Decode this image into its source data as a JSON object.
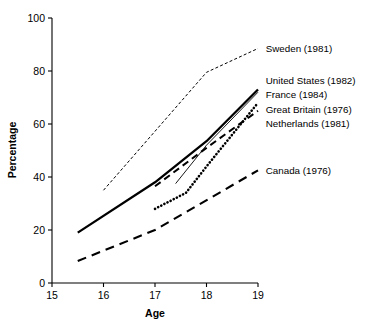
{
  "chart_data": {
    "type": "line",
    "title": "",
    "xlabel": "Age",
    "ylabel": "Percentage",
    "xlim": [
      15,
      19
    ],
    "ylim": [
      0,
      100
    ],
    "xticks": [
      "15",
      "16",
      "17",
      "18",
      "19"
    ],
    "yticks": [
      "0",
      "20",
      "40",
      "60",
      "80",
      "100"
    ],
    "grid": false,
    "legend_position": "right-inline-annotations",
    "series": [
      {
        "name": "Sweden (1981)",
        "label": "Sweden (1981)",
        "style": "fine-dashed",
        "x": [
          16.0,
          18.0,
          19.0
        ],
        "values": [
          35.0,
          79.5,
          88.5
        ],
        "label_x": 19.15,
        "label_y": 88.5
      },
      {
        "name": "United States (1982)",
        "label": "United States (1982)",
        "style": "solid-thick",
        "x": [
          15.5,
          17.0,
          18.0,
          19.0
        ],
        "values": [
          19.0,
          38.0,
          53.5,
          73.0
        ],
        "label_x": 19.15,
        "label_y": 76.5
      },
      {
        "name": "France (1984)",
        "label": "France (1984)",
        "style": "solid-thin",
        "x": [
          17.4,
          18.0,
          19.0
        ],
        "values": [
          37.5,
          52.0,
          72.0
        ],
        "label_x": 19.15,
        "label_y": 71.0
      },
      {
        "name": "Great Britain (1976)",
        "label": "Great Britain (1976)",
        "style": "dotted",
        "x": [
          17.0,
          17.6,
          18.0,
          19.0
        ],
        "values": [
          28.0,
          34.0,
          44.0,
          68.0
        ],
        "label_x": 19.15,
        "label_y": 65.5
      },
      {
        "name": "Netherlands (1981)",
        "label": "Netherlands (1981)",
        "style": "dashed-medium",
        "x": [
          17.0,
          18.0,
          19.0
        ],
        "values": [
          36.5,
          51.0,
          65.0
        ],
        "label_x": 19.15,
        "label_y": 60.0
      },
      {
        "name": "Canada (1976)",
        "label": "Canada (1976)",
        "style": "dashed-long",
        "x": [
          15.5,
          17.0,
          19.0
        ],
        "values": [
          8.3,
          20.0,
          42.5
        ],
        "label_x": 19.15,
        "label_y": 42.5
      }
    ]
  }
}
